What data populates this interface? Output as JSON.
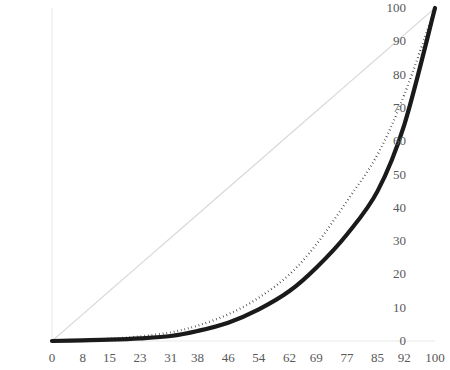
{
  "chart_data": {
    "type": "line",
    "title": "",
    "subtitle": "",
    "xlabel": "",
    "ylabel": "",
    "xlim": [
      0,
      100
    ],
    "ylim": [
      0,
      100
    ],
    "grid": false,
    "legend_position": "none",
    "x_tick_labels": [
      "0",
      "8",
      "15",
      "23",
      "31",
      "38",
      "46",
      "54",
      "62",
      "69",
      "77",
      "85",
      "92",
      "100"
    ],
    "y_tick_labels": [
      "0",
      "10",
      "20",
      "30",
      "40",
      "50",
      "60",
      "70",
      "80",
      "90",
      "100"
    ],
    "x": [
      0,
      8,
      15,
      23,
      31,
      38,
      46,
      54,
      62,
      69,
      77,
      85,
      92,
      100
    ],
    "series": [
      {
        "name": "line-of-equality",
        "style": "solid-thin",
        "color": "#d9d9d9",
        "values": [
          0,
          8,
          15,
          23,
          31,
          38,
          46,
          54,
          62,
          69,
          77,
          85,
          92,
          100
        ]
      },
      {
        "name": "dotted-curve",
        "style": "dotted",
        "color": "#1a1a1a",
        "values": [
          0,
          0.3,
          0.7,
          1.4,
          2.6,
          4.6,
          8.0,
          13.0,
          20.0,
          29.0,
          42.0,
          56.0,
          74.0,
          100
        ]
      },
      {
        "name": "solid-curve",
        "style": "solid-thick",
        "color": "#1a1a1a",
        "values": [
          0,
          0.2,
          0.4,
          0.8,
          1.5,
          3.0,
          5.5,
          9.5,
          15.0,
          22.0,
          32.0,
          45.0,
          65.0,
          100
        ]
      }
    ]
  },
  "axes": {
    "y_ticks": [
      {
        "label": "100",
        "value": 100
      },
      {
        "label": "90",
        "value": 90
      },
      {
        "label": "80",
        "value": 80
      },
      {
        "label": "70",
        "value": 70
      },
      {
        "label": "60",
        "value": 60
      },
      {
        "label": "50",
        "value": 50
      },
      {
        "label": "40",
        "value": 40
      },
      {
        "label": "30",
        "value": 30
      },
      {
        "label": "20",
        "value": 20
      },
      {
        "label": "10",
        "value": 10
      },
      {
        "label": "0",
        "value": 0
      }
    ],
    "x_ticks": [
      {
        "label": "0",
        "value": 0
      },
      {
        "label": "8",
        "value": 8
      },
      {
        "label": "15",
        "value": 15
      },
      {
        "label": "23",
        "value": 23
      },
      {
        "label": "31",
        "value": 31
      },
      {
        "label": "38",
        "value": 38
      },
      {
        "label": "46",
        "value": 46
      },
      {
        "label": "54",
        "value": 54
      },
      {
        "label": "62",
        "value": 62
      },
      {
        "label": "69",
        "value": 69
      },
      {
        "label": "77",
        "value": 77
      },
      {
        "label": "85",
        "value": 85
      },
      {
        "label": "92",
        "value": 92
      },
      {
        "label": "100",
        "value": 100
      }
    ],
    "axis_line_color": "#e8e8e8",
    "tick_text_color": "#585858"
  }
}
